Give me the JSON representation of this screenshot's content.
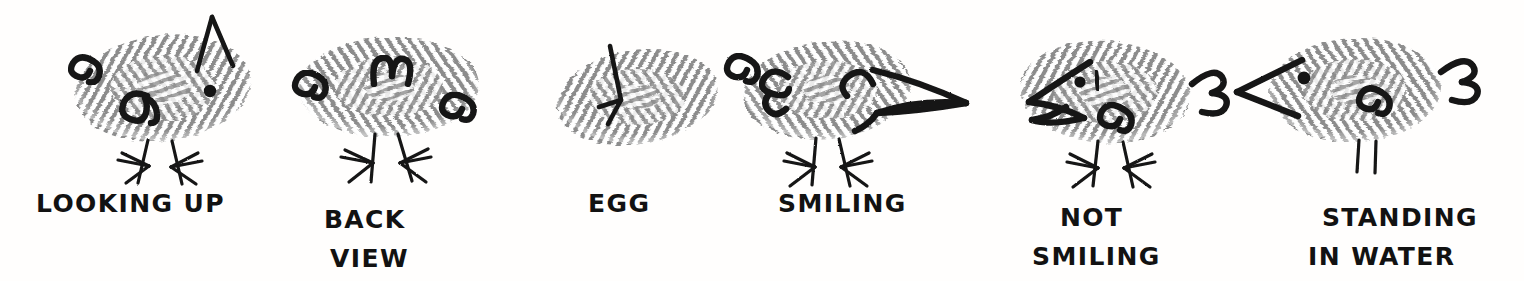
{
  "artwork": {
    "title": "Fingerprint bird drawing instructions",
    "medium": "thumbprint with pen lines",
    "background_color": "#fffefd",
    "ink_color": "#141414",
    "print_color": "#8c8c8c",
    "figure_count": 6
  },
  "figures": [
    {
      "id": "looking-up",
      "caption_line1": "LOOKING UP",
      "caption_line2": "",
      "parts": [
        "thumbprint-body",
        "upward-open-beak",
        "eye-dot",
        "wing-omega",
        "tail-omega",
        "two-legs-with-toes"
      ],
      "facing": "up-right"
    },
    {
      "id": "back-view",
      "caption_line1": "BACK",
      "caption_line2": "VIEW",
      "parts": [
        "thumbprint-body",
        "left-wing-omega",
        "center-tail-m",
        "right-wing-omega",
        "two-legs-with-toes"
      ],
      "facing": "away"
    },
    {
      "id": "egg",
      "caption_line1": "EGG",
      "caption_line2": "",
      "parts": [
        "thumbprint-body",
        "crack-line"
      ],
      "facing": "none"
    },
    {
      "id": "smiling",
      "caption_line1": "SMILING",
      "caption_line2": "",
      "parts": [
        "thumbprint-body",
        "open-beak-curved-up",
        "closed-happy-eye",
        "wing-epsilon",
        "tail-omega",
        "two-legs-with-toes"
      ],
      "facing": "right"
    },
    {
      "id": "not-smiling",
      "caption_line1": "NOT",
      "caption_line2": "SMILING",
      "parts": [
        "thumbprint-body",
        "open-beak-curved-down",
        "eye-dot-with-brow",
        "wing-omega",
        "tail-beta",
        "two-legs-with-toes"
      ],
      "facing": "left"
    },
    {
      "id": "standing-in-water",
      "caption_line1": "STANDING",
      "caption_line2": "IN WATER",
      "parts": [
        "thumbprint-body",
        "closed-beak-triangle",
        "eye-dot",
        "wing-omega",
        "tail-beta",
        "two-legs-no-feet"
      ],
      "facing": "left"
    }
  ]
}
